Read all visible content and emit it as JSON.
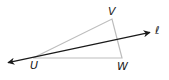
{
  "diagram": {
    "type": "geometry",
    "colors": {
      "triangle_stroke": "#bdbdbd",
      "line_stroke": "#1a1a1a",
      "label": "#1a1a1a",
      "background": "#ffffff"
    },
    "points": {
      "U": {
        "x": 33,
        "y": 58,
        "label": "U"
      },
      "V": {
        "x": 112,
        "y": 19,
        "label": "V"
      },
      "W": {
        "x": 122,
        "y": 58,
        "label": "W"
      }
    },
    "line": {
      "name": "ℓ",
      "start": {
        "x": 6,
        "y": 63
      },
      "end": {
        "x": 152,
        "y": 32
      },
      "arrows": "both"
    },
    "labels": {
      "U": "U",
      "V": "V",
      "W": "W",
      "line": "ℓ"
    }
  }
}
